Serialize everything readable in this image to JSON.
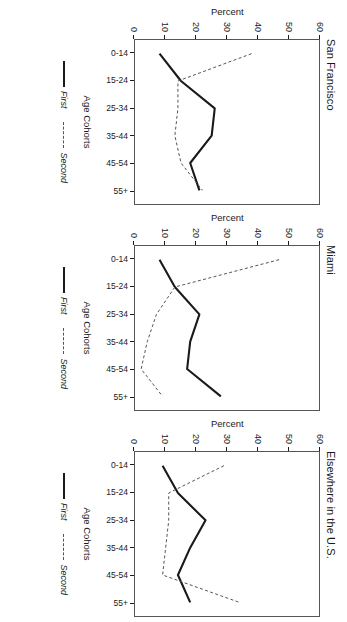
{
  "chart_data": [
    {
      "type": "line",
      "title": "San Francisco",
      "xlabel": "Age Cohorts",
      "ylabel": "Percent",
      "ylim": [
        0,
        60
      ],
      "yticks": [
        0,
        10,
        20,
        30,
        40,
        50,
        60
      ],
      "grid": false,
      "legend_position": "bottom",
      "categories": [
        "0-14",
        "15-24",
        "25-34",
        "35-44",
        "45-54",
        "55+"
      ],
      "series": [
        {
          "name": "First",
          "style": "solid",
          "values": [
            8,
            15,
            26,
            25,
            18,
            21
          ]
        },
        {
          "name": "Second",
          "style": "dashed",
          "values": [
            38,
            14,
            14,
            13,
            15,
            22
          ]
        }
      ]
    },
    {
      "type": "line",
      "title": "Miami",
      "xlabel": "Age Cohorts",
      "ylabel": "Percent",
      "ylim": [
        0,
        60
      ],
      "yticks": [
        0,
        10,
        20,
        30,
        40,
        50,
        60
      ],
      "grid": false,
      "legend_position": "bottom",
      "categories": [
        "0-14",
        "15-24",
        "25-34",
        "35-44",
        "45-54",
        "55+"
      ],
      "series": [
        {
          "name": "First",
          "style": "solid",
          "values": [
            8,
            13,
            21,
            18,
            17,
            28
          ]
        },
        {
          "name": "Second",
          "style": "dashed",
          "values": [
            47,
            13,
            7,
            4,
            2,
            9
          ]
        }
      ]
    },
    {
      "type": "line",
      "title": "Elsewhere in the U.S.",
      "xlabel": "Age Cohorts",
      "ylabel": "Percent",
      "ylim": [
        0,
        60
      ],
      "yticks": [
        0,
        10,
        20,
        30,
        40,
        50,
        60
      ],
      "grid": false,
      "legend_position": "bottom",
      "categories": [
        "0-14",
        "15-24",
        "25-34",
        "35-44",
        "45-54",
        "55+"
      ],
      "series": [
        {
          "name": "First",
          "style": "solid",
          "values": [
            9,
            14,
            23,
            18,
            14,
            18
          ]
        },
        {
          "name": "Second",
          "style": "dashed",
          "values": [
            29,
            11,
            11,
            10,
            9,
            34
          ]
        }
      ]
    }
  ],
  "figure": {
    "panels": [
      {
        "title": "San Francisco",
        "ylabel": "Percent",
        "xlabel": "Age Cohorts",
        "yticks": [
          "60",
          "50",
          "40",
          "30",
          "20",
          "10",
          "0"
        ],
        "xticks": [
          "0-14",
          "15-24",
          "25-34",
          "35-44",
          "45-54",
          "55+"
        ],
        "legend": [
          {
            "label": "First",
            "style": "solid"
          },
          {
            "label": "Second",
            "style": "dashed"
          }
        ]
      },
      {
        "title": "Miami",
        "ylabel": "Percent",
        "xlabel": "Age Cohorts",
        "yticks": [
          "60",
          "50",
          "40",
          "30",
          "20",
          "10",
          "0"
        ],
        "xticks": [
          "0-14",
          "15-24",
          "25-34",
          "35-44",
          "45-54",
          "55+"
        ],
        "legend": [
          {
            "label": "First",
            "style": "solid"
          },
          {
            "label": "Second",
            "style": "dashed"
          }
        ]
      },
      {
        "title": "Elsewhere in the U.S.",
        "ylabel": "Percent",
        "xlabel": "Age Cohorts",
        "yticks": [
          "60",
          "50",
          "40",
          "30",
          "20",
          "10",
          "0"
        ],
        "xticks": [
          "0-14",
          "15-24",
          "25-34",
          "35-44",
          "45-54",
          "55+"
        ],
        "legend": [
          {
            "label": "First",
            "style": "solid"
          },
          {
            "label": "Second",
            "style": "dashed"
          }
        ]
      }
    ],
    "colors": {
      "first_line": "#1a1a1a",
      "second_line": "#555555",
      "axis": "#555555",
      "background": "#ffffff"
    }
  }
}
